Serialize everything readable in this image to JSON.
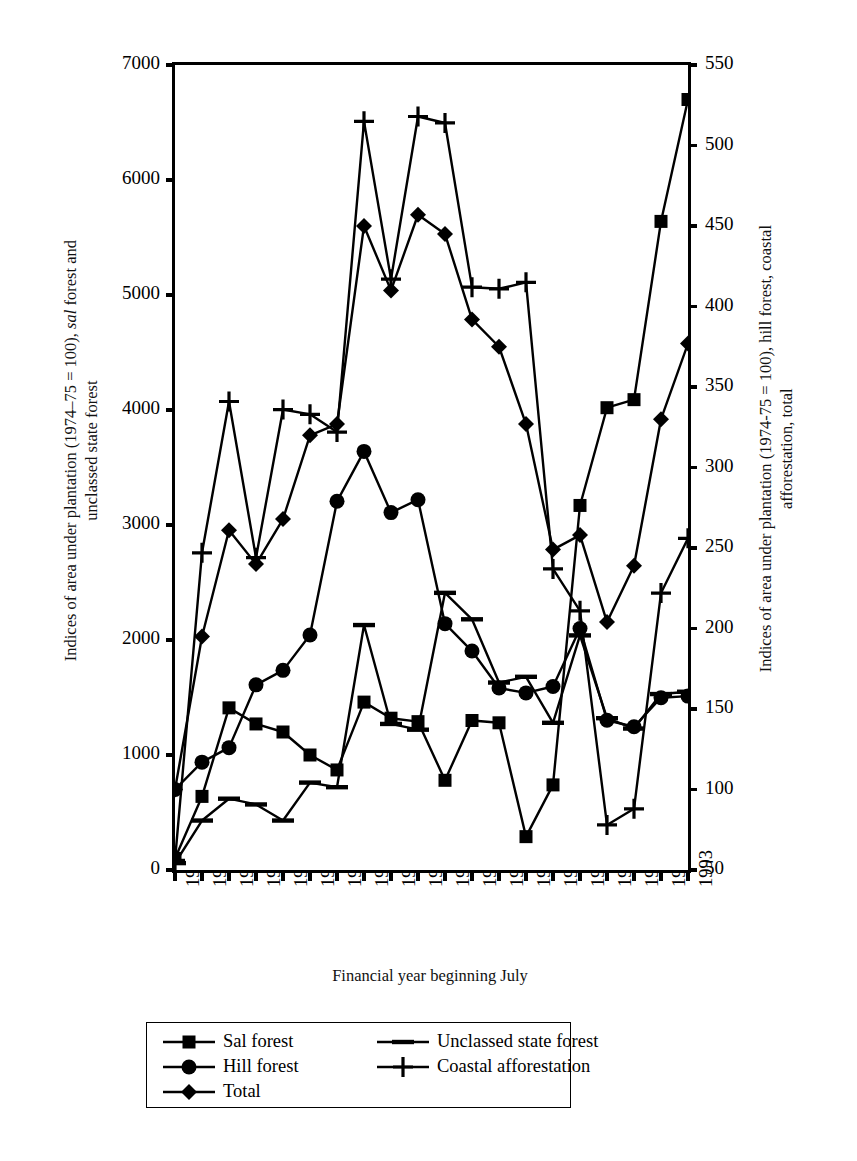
{
  "chart_data": {
    "type": "line",
    "title": "",
    "xlabel": "Financial year beginning July",
    "ylabel_left": "Indices of area under plantation (1974–75 = 100), sal forest and unclassed state forest",
    "ylabel_left_part1": "Indices of area under plantation (1974–75 = 100), ",
    "ylabel_left_italic": "sal",
    "ylabel_left_part2": " forest and",
    "ylabel_left_line2": "unclassed state forest",
    "ylabel_right": "Indices of area under plantation (1974-75 = 100), hill forest, coastal afforestation, total",
    "ylabel_right_line1": "Indices of area under plantation (1974-75 = 100), hill forest, coastal",
    "ylabel_right_line2": "afforestation, total",
    "grid": false,
    "legend_position": "bottom",
    "x": [
      "1974",
      "1975",
      "1976",
      "1977",
      "1978",
      "1979",
      "1980",
      "1981",
      "1982",
      "1983",
      "1984",
      "1985",
      "1986",
      "1987",
      "1988",
      "1989",
      "1990",
      "1991",
      "1992",
      "1993"
    ],
    "xlim": [
      1974,
      1993
    ],
    "ylim_left": [
      0,
      7000
    ],
    "ylim_right": [
      50,
      550
    ],
    "yticks_left": [
      "0",
      "1000",
      "2000",
      "3000",
      "4000",
      "5000",
      "6000",
      "7000"
    ],
    "yticks_right": [
      "50",
      "100",
      "150",
      "200",
      "250",
      "300",
      "350",
      "400",
      "450",
      "500",
      "550"
    ],
    "series": [
      {
        "name": "Sal forest",
        "axis": "left",
        "marker": "square",
        "values": [
          100,
          640,
          1410,
          1270,
          1200,
          1000,
          870,
          1460,
          1320,
          1290,
          780,
          1300,
          1280,
          290,
          740,
          3170,
          4020,
          4090,
          5640,
          6700
        ]
      },
      {
        "name": "Unclassed state forest",
        "axis": "left",
        "marker": "dash",
        "values": [
          60,
          430,
          620,
          570,
          430,
          760,
          720,
          2130,
          1270,
          1220,
          2410,
          2180,
          1630,
          1680,
          1280,
          2040,
          1320,
          1230,
          1530,
          1550
        ]
      },
      {
        "name": "Hill forest",
        "axis": "right",
        "marker": "circle",
        "values": [
          100,
          117,
          126,
          165,
          174,
          196,
          279,
          310,
          272,
          280,
          203,
          186,
          163,
          160,
          164,
          200,
          143,
          139,
          157,
          158
        ]
      },
      {
        "name": "Coastal afforestation",
        "axis": "right",
        "marker": "plus",
        "values": [
          56,
          247,
          341,
          244,
          336,
          333,
          322,
          515,
          417,
          518,
          514,
          412,
          411,
          415,
          237,
          211,
          78,
          88,
          222,
          256
        ]
      },
      {
        "name": "Total",
        "axis": "right",
        "marker": "diamond",
        "values": [
          100,
          195,
          261,
          240,
          268,
          320,
          327,
          450,
          410,
          457,
          445,
          392,
          375,
          327,
          249,
          258,
          204,
          239,
          330,
          377
        ]
      }
    ],
    "legend": [
      {
        "label": "Sal forest",
        "marker": "square"
      },
      {
        "label": "Hill forest",
        "marker": "circle"
      },
      {
        "label": "Total",
        "marker": "diamond"
      },
      {
        "label": "Unclassed state forest",
        "marker": "dash"
      },
      {
        "label": "Coastal afforestation",
        "marker": "plus"
      }
    ],
    "colors": {
      "ink": "#000000",
      "background": "#ffffff"
    }
  }
}
